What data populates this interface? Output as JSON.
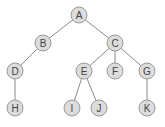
{
  "diagram": {
    "type": "tree",
    "colors": {
      "node_fill": "#dcdcdc",
      "node_stroke": "#9a9a9a",
      "edge": "#8a8a8a",
      "label": "#444444"
    },
    "nodes": [
      {
        "id": "A",
        "label": "A",
        "x": 79,
        "y": 15
      },
      {
        "id": "B",
        "label": "B",
        "x": 43,
        "y": 43
      },
      {
        "id": "C",
        "label": "C",
        "x": 115,
        "y": 43
      },
      {
        "id": "D",
        "label": "D",
        "x": 15,
        "y": 71
      },
      {
        "id": "E",
        "label": "E",
        "x": 84,
        "y": 71
      },
      {
        "id": "F",
        "label": "F",
        "x": 115,
        "y": 71
      },
      {
        "id": "G",
        "label": "G",
        "x": 147,
        "y": 71
      },
      {
        "id": "H",
        "label": "H",
        "x": 15,
        "y": 108
      },
      {
        "id": "I",
        "label": "I",
        "x": 72,
        "y": 108
      },
      {
        "id": "J",
        "label": "J",
        "x": 99,
        "y": 108
      },
      {
        "id": "K",
        "label": "K",
        "x": 147,
        "y": 108
      }
    ],
    "edges": [
      [
        "A",
        "B"
      ],
      [
        "A",
        "C"
      ],
      [
        "B",
        "D"
      ],
      [
        "C",
        "E"
      ],
      [
        "C",
        "F"
      ],
      [
        "C",
        "G"
      ],
      [
        "D",
        "H"
      ],
      [
        "E",
        "I"
      ],
      [
        "E",
        "J"
      ],
      [
        "G",
        "K"
      ]
    ]
  }
}
